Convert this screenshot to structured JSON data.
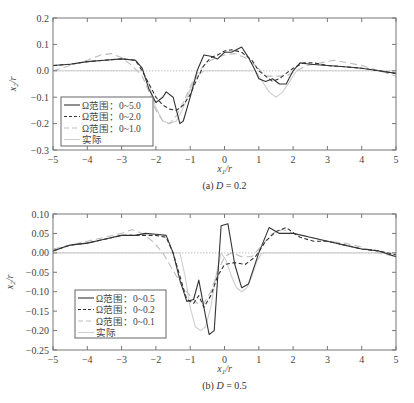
{
  "chart_data": [
    {
      "type": "line",
      "title": "",
      "caption": "(a) D = 0.2",
      "caption_parts": {
        "prefix": "(a) ",
        "var": "D",
        "suffix": " = 0.2"
      },
      "xlabel": "x1/r",
      "ylabel": "x2/r",
      "xlim": [
        -5,
        5
      ],
      "ylim": [
        -0.3,
        0.2
      ],
      "xticks": [
        -5,
        -4,
        -3,
        -2,
        -1,
        0,
        1,
        2,
        3,
        4,
        5
      ],
      "yticks": [
        -0.3,
        -0.2,
        -0.1,
        0.0,
        0.1,
        0.2
      ],
      "ytick_labels": [
        "−0.3",
        "−0.2",
        "−0.1",
        "0.0",
        "0.1",
        "0.2"
      ],
      "xtick_labels": [
        "−5",
        "−4",
        "−3",
        "−2",
        "−1",
        "0",
        "1",
        "2",
        "3",
        "4",
        "5"
      ],
      "grid": false,
      "legend_position": "lower-left",
      "series": [
        {
          "name": "Ω范围：0~5.0",
          "style": "solid",
          "color": "#333333",
          "x": [
            -5,
            -4.5,
            -4,
            -3.5,
            -3,
            -2.6,
            -2.4,
            -2.2,
            -2.0,
            -1.8,
            -1.7,
            -1.5,
            -1.3,
            -1.2,
            -1.0,
            -0.8,
            -0.6,
            -0.4,
            -0.2,
            0,
            0.2,
            0.5,
            0.7,
            0.9,
            1.0,
            1.2,
            1.4,
            1.6,
            1.8,
            2.0,
            2.2,
            2.5,
            3,
            3.5,
            4,
            4.5,
            5
          ],
          "y": [
            0.02,
            0.025,
            0.035,
            0.04,
            0.045,
            0.04,
            0.01,
            -0.07,
            -0.12,
            -0.1,
            -0.08,
            -0.1,
            -0.2,
            -0.19,
            -0.1,
            0.0,
            0.06,
            0.055,
            0.045,
            0.07,
            0.07,
            0.09,
            0.05,
            0.0,
            -0.03,
            -0.04,
            -0.03,
            -0.05,
            -0.05,
            0.0,
            0.03,
            0.025,
            0.02,
            0.015,
            0.01,
            0.0,
            -0.01
          ]
        },
        {
          "name": "Ω范围：0~2.0",
          "style": "dashed",
          "color": "#333333",
          "x": [
            -5,
            -4.5,
            -4,
            -3.5,
            -3,
            -2.6,
            -2.4,
            -2.2,
            -2.0,
            -1.8,
            -1.6,
            -1.4,
            -1.2,
            -1.0,
            -0.8,
            -0.6,
            -0.4,
            -0.2,
            0,
            0.2,
            0.5,
            0.8,
            1.0,
            1.2,
            1.4,
            1.6,
            1.8,
            2.0,
            2.3,
            2.6,
            3,
            3.5,
            4,
            4.5,
            5
          ],
          "y": [
            0.02,
            0.025,
            0.035,
            0.04,
            0.045,
            0.04,
            0.0,
            -0.05,
            -0.1,
            -0.13,
            -0.145,
            -0.15,
            -0.13,
            -0.09,
            -0.03,
            0.02,
            0.05,
            0.06,
            0.075,
            0.08,
            0.07,
            0.04,
            0.0,
            -0.02,
            -0.04,
            -0.03,
            -0.01,
            0.01,
            0.03,
            0.03,
            0.02,
            0.015,
            0.01,
            0.0,
            -0.01
          ]
        },
        {
          "name": "Ω范围：0~1.0",
          "style": "long-dashed",
          "color": "#bbbbbb",
          "x": [
            -5,
            -4.5,
            -4,
            -3.6,
            -3.3,
            -3.0,
            -2.7,
            -2.4,
            -2.2,
            -2.0,
            -1.8,
            -1.6,
            -1.4,
            -1.2,
            -1.0,
            -0.8,
            -0.6,
            -0.4,
            -0.2,
            0,
            0.3,
            0.6,
            0.9,
            1.2,
            1.5,
            1.8,
            2.1,
            2.4,
            2.8,
            3.2,
            3.6,
            4,
            4.5,
            5
          ],
          "y": [
            0.0,
            0.02,
            0.04,
            0.06,
            0.065,
            0.05,
            0.02,
            -0.02,
            -0.08,
            -0.15,
            -0.19,
            -0.2,
            -0.17,
            -0.12,
            -0.06,
            -0.01,
            0.02,
            0.04,
            0.05,
            0.06,
            0.065,
            0.05,
            0.02,
            -0.02,
            -0.02,
            -0.02,
            0.0,
            0.02,
            0.03,
            0.04,
            0.03,
            0.02,
            0.0,
            -0.02
          ]
        },
        {
          "name": "实际",
          "style": "solid-light",
          "color": "#cccccc",
          "x": [
            -5,
            -2.4,
            -2.2,
            -2.0,
            -1.8,
            -1.6,
            -1.4,
            -1.2,
            -1.0,
            -0.8,
            -0.6,
            0.9,
            1.1,
            1.3,
            1.5,
            1.7,
            1.9,
            2.1,
            5
          ],
          "y": [
            0.0,
            0.0,
            -0.05,
            -0.14,
            -0.19,
            -0.2,
            -0.19,
            -0.14,
            -0.07,
            -0.02,
            0.0,
            0.0,
            -0.04,
            -0.08,
            -0.1,
            -0.08,
            -0.04,
            0.0,
            0.0
          ]
        },
        {
          "name": "zero-reference",
          "style": "dotted",
          "color": "#bbbbbb",
          "x": [
            -5,
            5
          ],
          "y": [
            0,
            0
          ]
        }
      ]
    },
    {
      "type": "line",
      "title": "",
      "caption": "(b) D = 0.5",
      "caption_parts": {
        "prefix": "(b) ",
        "var": "D",
        "suffix": " = 0.5"
      },
      "xlabel": "x1/r",
      "ylabel": "x2/r",
      "xlim": [
        -5,
        5
      ],
      "ylim": [
        -0.25,
        0.1
      ],
      "xticks": [
        -5,
        -4,
        -3,
        -2,
        -1,
        0,
        1,
        2,
        3,
        4,
        5
      ],
      "yticks": [
        -0.25,
        -0.2,
        -0.15,
        -0.1,
        -0.05,
        0.0,
        0.05,
        0.1
      ],
      "ytick_labels": [
        "−0.25",
        "−0.20",
        "−0.15",
        "−0.10",
        "−0.05",
        "0.00",
        "0.05",
        "0.10"
      ],
      "xtick_labels": [
        "−5",
        "−4",
        "−3",
        "−2",
        "−1",
        "0",
        "1",
        "2",
        "3",
        "4",
        "5"
      ],
      "grid": false,
      "legend_position": "lower-left",
      "series": [
        {
          "name": "Ω范围：0~0.5",
          "style": "solid",
          "color": "#333333",
          "x": [
            -5,
            -4.5,
            -4,
            -3.5,
            -3,
            -2.6,
            -2.3,
            -2.0,
            -1.7,
            -1.5,
            -1.3,
            -1.1,
            -0.9,
            -0.75,
            -0.6,
            -0.45,
            -0.3,
            -0.1,
            0.1,
            0.3,
            0.5,
            0.7,
            1.0,
            1.3,
            1.6,
            2.0,
            2.5,
            3,
            3.5,
            4,
            4.5,
            5
          ],
          "y": [
            0.005,
            0.02,
            0.025,
            0.035,
            0.045,
            0.045,
            0.05,
            0.048,
            0.045,
            0.0,
            -0.07,
            -0.125,
            -0.12,
            -0.07,
            -0.14,
            -0.21,
            -0.2,
            0.07,
            0.075,
            -0.03,
            -0.09,
            -0.08,
            0.0,
            0.065,
            0.05,
            0.05,
            0.04,
            0.03,
            0.02,
            0.01,
            0.005,
            -0.01
          ]
        },
        {
          "name": "Ω范围：0~0.2",
          "style": "dashed",
          "color": "#333333",
          "x": [
            -5,
            -4.5,
            -4,
            -3.5,
            -3,
            -2.6,
            -2.3,
            -2.0,
            -1.7,
            -1.5,
            -1.3,
            -1.1,
            -0.9,
            -0.75,
            -0.6,
            -0.4,
            -0.2,
            0,
            0.3,
            0.6,
            0.9,
            1.2,
            1.5,
            1.8,
            2.2,
            2.6,
            3,
            3.5,
            4,
            4.5,
            5
          ],
          "y": [
            0.005,
            0.02,
            0.025,
            0.035,
            0.045,
            0.045,
            0.045,
            0.045,
            0.04,
            0.0,
            -0.06,
            -0.12,
            -0.13,
            -0.11,
            -0.14,
            -0.11,
            -0.06,
            -0.03,
            -0.025,
            -0.03,
            -0.01,
            0.03,
            0.055,
            0.065,
            0.04,
            0.03,
            0.03,
            0.02,
            0.01,
            0.005,
            -0.005
          ]
        },
        {
          "name": "Ω范围：0~0.1",
          "style": "long-dashed",
          "color": "#bbbbbb",
          "x": [
            -5,
            -4.5,
            -4,
            -3.5,
            -3,
            -2.7,
            -2.4,
            -2.1,
            -1.8,
            -1.6,
            -1.4,
            -1.2,
            -1.0,
            -0.8,
            -0.6,
            -0.4,
            -0.2,
            0,
            0.2,
            0.5,
            0.8,
            1.1,
            1.4,
            1.7,
            2.0,
            2.5,
            3,
            3.5,
            4,
            4.5,
            5
          ],
          "y": [
            0.01,
            0.02,
            0.03,
            0.04,
            0.05,
            0.06,
            0.05,
            0.03,
            0.0,
            -0.03,
            -0.06,
            -0.09,
            -0.11,
            -0.13,
            -0.13,
            -0.1,
            -0.05,
            -0.01,
            0.0,
            -0.01,
            -0.01,
            0.02,
            0.05,
            0.06,
            0.05,
            0.04,
            0.03,
            0.025,
            0.015,
            0.0,
            -0.01
          ]
        },
        {
          "name": "实际",
          "style": "solid-light",
          "color": "#cccccc",
          "x": [
            -5,
            -1.3,
            -1.15,
            -1.0,
            -0.85,
            -0.7,
            -0.55,
            -0.4,
            -0.25,
            -0.1,
            0.05,
            0.2,
            0.35,
            0.5,
            0.65,
            0.8,
            0.95,
            1.1,
            5
          ],
          "y": [
            0.0,
            0.0,
            -0.06,
            -0.14,
            -0.19,
            -0.2,
            -0.19,
            -0.14,
            -0.06,
            0.0,
            -0.02,
            -0.06,
            -0.09,
            -0.1,
            -0.09,
            -0.06,
            -0.02,
            0.0,
            0.0
          ]
        },
        {
          "name": "zero-reference",
          "style": "dotted",
          "color": "#bbbbbb",
          "x": [
            -5,
            5
          ],
          "y": [
            0,
            0
          ]
        }
      ]
    }
  ]
}
